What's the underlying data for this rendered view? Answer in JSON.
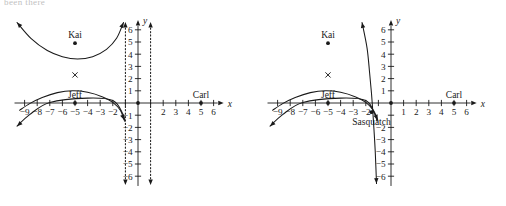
{
  "figure": {
    "clipped_header_text": "been there",
    "background_color": "#ffffff",
    "ink_color": "#1a1a1a"
  },
  "chart_data": [
    {
      "type": "line",
      "panel": "left",
      "title": "",
      "xlabel": "x",
      "ylabel": "y",
      "xlim": [
        -9.8,
        6.8
      ],
      "ylim": [
        -6.8,
        6.8
      ],
      "grid": false,
      "legend": "none",
      "x_ticks": [
        -9,
        -8,
        -7,
        -6,
        -5,
        -4,
        -3,
        -2,
        -1,
        1,
        2,
        3,
        4,
        5,
        6
      ],
      "x_tick_labels": [
        "-9",
        "-8",
        "-7",
        "-6",
        "-5",
        "-4",
        "-3",
        "-2",
        "",
        "",
        "2",
        "3",
        "4",
        "5",
        "6"
      ],
      "y_ticks": [
        -6,
        -5,
        -4,
        -3,
        -2,
        -1,
        1,
        2,
        3,
        4,
        5,
        6
      ],
      "y_tick_labels": [
        "-6",
        "-5",
        "-4",
        "-3",
        "-2",
        "-1",
        "1",
        "2",
        "3",
        "4",
        "5",
        "6"
      ],
      "asymptotes": [
        {
          "kind": "vertical",
          "x": -1,
          "style": "dotted"
        },
        {
          "kind": "vertical",
          "x": 1,
          "style": "dotted"
        }
      ],
      "series": [
        {
          "name": "upper-branch",
          "style": "solid",
          "arrow_start": true,
          "arrow_end": true,
          "points": [
            [
              -9.6,
              6.6
            ],
            [
              -8.5,
              5.3
            ],
            [
              -7.2,
              4.3
            ],
            [
              -6.0,
              3.8
            ],
            [
              -4.8,
              3.6
            ],
            [
              -3.6,
              3.8
            ],
            [
              -2.5,
              4.4
            ],
            [
              -1.7,
              5.3
            ],
            [
              -1.15,
              6.6
            ]
          ]
        },
        {
          "name": "hump-curve",
          "style": "solid",
          "arrow_start": false,
          "arrow_end": true,
          "points": [
            [
              -9.4,
              -0.6
            ],
            [
              -8.6,
              -0.05
            ],
            [
              -7.6,
              0.45
            ],
            [
              -6.4,
              0.85
            ],
            [
              -5.2,
              1.0
            ],
            [
              -4.0,
              0.88
            ],
            [
              -2.8,
              0.5
            ],
            [
              -2.0,
              0.05
            ],
            [
              -1.4,
              -0.6
            ],
            [
              -1.1,
              -1.4
            ]
          ]
        },
        {
          "name": "descending-ray",
          "style": "solid",
          "arrow_start": true,
          "arrow_end": false,
          "points": [
            [
              -9.6,
              -1.9
            ],
            [
              -8.6,
              -0.95
            ],
            [
              -7.0,
              0.05
            ],
            [
              -4.0,
              0.4
            ],
            [
              -2.0,
              0.2
            ],
            [
              -1.2,
              -0.9
            ],
            [
              -1.05,
              -1.5
            ]
          ]
        }
      ],
      "annotations": [
        {
          "label": "Kai",
          "x": -5.0,
          "y": 4.9,
          "marker": "dot"
        },
        {
          "label": "",
          "x": -5.0,
          "y": 2.3,
          "marker": "x"
        },
        {
          "label": "Jeff",
          "x": -5.0,
          "y": 0.0,
          "marker": "dot"
        },
        {
          "label": "Carl",
          "x": 5.0,
          "y": 0.0,
          "marker": "dot"
        },
        {
          "label": "",
          "x": 0.0,
          "y": 0.0,
          "marker": "dot"
        }
      ]
    },
    {
      "type": "line",
      "panel": "right",
      "title": "",
      "xlabel": "x",
      "ylabel": "y",
      "xlim": [
        -9.8,
        6.8
      ],
      "ylim": [
        -6.8,
        6.8
      ],
      "grid": false,
      "legend": "none",
      "x_ticks": [
        -9,
        -8,
        -7,
        -6,
        -5,
        -4,
        -3,
        -2,
        -1,
        1,
        2,
        3,
        4,
        5,
        6
      ],
      "x_tick_labels": [
        "-9",
        "-8",
        "-7",
        "-6",
        "-5",
        "-4",
        "-3",
        "-2",
        "",
        "1",
        "2",
        "3",
        "4",
        "5",
        "6"
      ],
      "y_ticks": [
        -6,
        -5,
        -4,
        -3,
        -2,
        -1,
        1,
        2,
        3,
        4,
        5,
        6
      ],
      "y_tick_labels": [
        "-6",
        "-5",
        "-4",
        "-3",
        "-2",
        "",
        "1",
        "2",
        "3",
        "4",
        "5",
        "6"
      ],
      "asymptotes": [],
      "series": [
        {
          "name": "steep-curve",
          "style": "solid",
          "arrow_start": true,
          "arrow_end": true,
          "points": [
            [
              -2.3,
              6.6
            ],
            [
              -1.9,
              4.5
            ],
            [
              -1.7,
              2.5
            ],
            [
              -1.55,
              0.8
            ],
            [
              -1.45,
              -0.6
            ],
            [
              -1.35,
              -2.2
            ],
            [
              -1.25,
              -4.0
            ],
            [
              -1.15,
              -6.6
            ]
          ]
        },
        {
          "name": "hump-curve",
          "style": "solid",
          "arrow_start": false,
          "arrow_end": true,
          "points": [
            [
              -9.4,
              -0.6
            ],
            [
              -8.6,
              -0.05
            ],
            [
              -7.6,
              0.45
            ],
            [
              -6.4,
              0.85
            ],
            [
              -5.2,
              1.0
            ],
            [
              -4.0,
              0.88
            ],
            [
              -2.8,
              0.5
            ],
            [
              -2.0,
              0.05
            ],
            [
              -1.4,
              -0.6
            ],
            [
              -1.05,
              -1.4
            ]
          ]
        },
        {
          "name": "descending-ray",
          "style": "solid",
          "arrow_start": true,
          "arrow_end": false,
          "points": [
            [
              -9.6,
              -1.9
            ],
            [
              -8.6,
              -0.95
            ],
            [
              -7.0,
              0.05
            ],
            [
              -4.0,
              0.4
            ],
            [
              -2.0,
              0.2
            ],
            [
              -1.3,
              -0.9
            ],
            [
              -1.1,
              -1.5
            ]
          ]
        }
      ],
      "annotations": [
        {
          "label": "Kai",
          "x": -5.0,
          "y": 4.9,
          "marker": "dot"
        },
        {
          "label": "",
          "x": -5.0,
          "y": 2.3,
          "marker": "x"
        },
        {
          "label": "Jeff",
          "x": -5.0,
          "y": 0.0,
          "marker": "dot"
        },
        {
          "label": "Sasquatch",
          "x": -1.55,
          "y": -0.75,
          "marker": "dot"
        },
        {
          "label": "Carl",
          "x": 5.0,
          "y": 0.0,
          "marker": "dot"
        },
        {
          "label": "",
          "x": 0.0,
          "y": 0.0,
          "marker": "dot"
        }
      ]
    }
  ]
}
